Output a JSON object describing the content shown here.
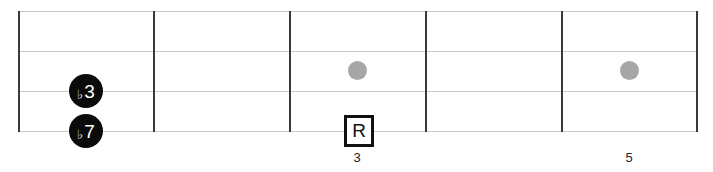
{
  "diagram": {
    "type": "fretboard",
    "strings": 4,
    "frets_shown": 5,
    "colors": {
      "string": "#c8c8c8",
      "fret": "#3a3a3a",
      "inlay": "#a6a6a6",
      "note_fill": "#0b0b0b",
      "root_border": "#111111"
    },
    "notes": [
      {
        "id": "flat3",
        "flat": "♭",
        "degree": "3",
        "string": 3,
        "fret": 1
      },
      {
        "id": "flat7",
        "flat": "♭",
        "degree": "7",
        "string": 4,
        "fret": 1
      },
      {
        "id": "root",
        "label": "R",
        "string": 4,
        "fret": 3
      }
    ],
    "inlays": [
      {
        "fret": 3
      },
      {
        "fret": 5
      }
    ],
    "fret_numbers": [
      {
        "fret": 3,
        "label": "3"
      },
      {
        "fret": 5,
        "label": "5"
      }
    ]
  }
}
